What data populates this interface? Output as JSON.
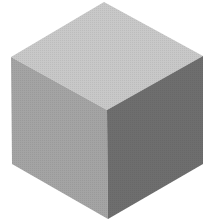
{
  "scene": {
    "subject": "isometric cube",
    "background": "#ffffff",
    "faces": {
      "top": "#c8c8c8",
      "left": "#a4a4a4",
      "right": "#6e6e6e"
    }
  }
}
